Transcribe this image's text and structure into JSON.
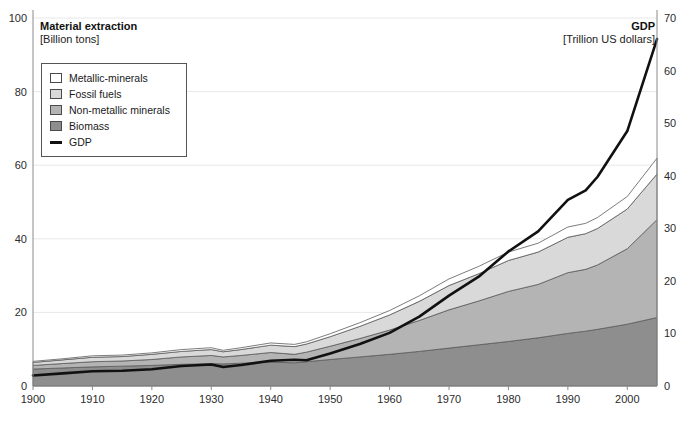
{
  "header": {
    "left_title": "Material extraction",
    "left_unit": "[Billion tons]",
    "right_title": "GDP",
    "right_unit": "[Trillion US dollars]"
  },
  "legend": {
    "items": [
      {
        "label": "Metallic-minerals",
        "color": "#ffffff",
        "type": "swatch"
      },
      {
        "label": "Fossil fuels",
        "color": "#d9d9d9",
        "type": "swatch"
      },
      {
        "label": "Non-metallic minerals",
        "color": "#b4b4b4",
        "type": "swatch"
      },
      {
        "label": "Biomass",
        "color": "#8e8e8e",
        "type": "swatch"
      },
      {
        "label": "GDP",
        "color": "#111111",
        "type": "line"
      }
    ]
  },
  "footnote": "",
  "chart_data": {
    "type": "area",
    "title": "Material extraction",
    "subtitle": "[Billion tons]",
    "xlabel": "",
    "ylabel": "Material extraction [Billion tons]",
    "y2label": "GDP [Trillion US dollars]",
    "xlim": [
      1900,
      2005
    ],
    "ylim": [
      0,
      100
    ],
    "y2lim": [
      0,
      70
    ],
    "xticks": [
      1900,
      1910,
      1920,
      1930,
      1940,
      1950,
      1960,
      1970,
      1980,
      1990,
      2000
    ],
    "yticks": [
      0,
      20,
      40,
      60,
      80,
      100
    ],
    "y2ticks": [
      0,
      10,
      20,
      30,
      40,
      50,
      60,
      70
    ],
    "grid": true,
    "legend_position": "upper-left",
    "stacked": true,
    "stack_order_bottom_to_top": [
      "Biomass",
      "Non-metallic minerals",
      "Fossil fuels",
      "Metallic-minerals"
    ],
    "x": [
      1900,
      1905,
      1910,
      1915,
      1920,
      1925,
      1930,
      1932,
      1935,
      1940,
      1944,
      1946,
      1950,
      1955,
      1960,
      1965,
      1970,
      1975,
      1980,
      1985,
      1990,
      1993,
      1995,
      2000,
      2005
    ],
    "series": [
      {
        "name": "Biomass",
        "axis": "left",
        "color": "#8e8e8e",
        "values": [
          4.6,
          4.9,
          5.2,
          5.4,
          5.6,
          5.9,
          6.1,
          6.0,
          6.2,
          6.5,
          6.3,
          6.6,
          7.2,
          7.9,
          8.6,
          9.4,
          10.3,
          11.2,
          12.1,
          13.1,
          14.3,
          14.9,
          15.4,
          16.8,
          18.6
        ]
      },
      {
        "name": "Non-metallic minerals",
        "axis": "left",
        "color": "#b4b4b4",
        "values": [
          1.0,
          1.2,
          1.4,
          1.4,
          1.6,
          2.0,
          2.2,
          1.9,
          2.1,
          2.6,
          2.3,
          2.6,
          3.6,
          5.0,
          6.6,
          8.4,
          10.4,
          11.9,
          13.6,
          14.5,
          16.5,
          16.8,
          17.5,
          20.5,
          26.6
        ]
      },
      {
        "name": "Fossil fuels",
        "axis": "left",
        "color": "#d9d9d9",
        "values": [
          0.8,
          1.0,
          1.2,
          1.2,
          1.4,
          1.5,
          1.6,
          1.4,
          1.6,
          2.0,
          2.1,
          2.2,
          2.6,
          3.3,
          4.1,
          5.2,
          6.6,
          7.4,
          8.4,
          8.8,
          9.6,
          9.7,
          9.9,
          10.8,
          12.4
        ]
      },
      {
        "name": "Metallic-minerals",
        "axis": "left",
        "color": "#ffffff",
        "values": [
          0.3,
          0.3,
          0.4,
          0.4,
          0.4,
          0.5,
          0.5,
          0.4,
          0.5,
          0.6,
          0.6,
          0.6,
          0.8,
          1.0,
          1.2,
          1.5,
          1.8,
          2.0,
          2.3,
          2.4,
          2.8,
          2.8,
          3.0,
          3.4,
          4.3
        ]
      },
      {
        "name": "GDP",
        "axis": "right",
        "color": "#111111",
        "type": "line",
        "values": [
          2.0,
          2.4,
          2.8,
          2.9,
          3.2,
          3.8,
          4.1,
          3.6,
          4.0,
          4.8,
          5.0,
          4.9,
          6.2,
          8.0,
          10.1,
          13.2,
          17.2,
          20.8,
          25.6,
          29.4,
          35.4,
          37.2,
          39.8,
          48.5,
          66.0
        ]
      }
    ],
    "totals_material": [
      6.7,
      7.4,
      8.2,
      8.4,
      9.0,
      9.9,
      10.4,
      9.7,
      10.4,
      11.7,
      11.3,
      12.0,
      14.2,
      17.2,
      20.5,
      24.5,
      29.1,
      32.5,
      36.4,
      38.8,
      43.2,
      44.2,
      45.8,
      51.5,
      61.9
    ]
  }
}
